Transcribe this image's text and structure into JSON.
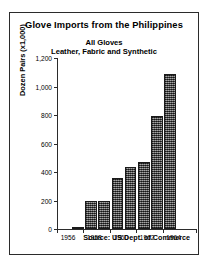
{
  "chart_data": {
    "type": "bar",
    "title": "Glove Imports from the  Philippines",
    "subtitle_line1": "All Gloves",
    "subtitle_line2": "Leather, Fabric and Synthetic",
    "xlabel": "",
    "ylabel": "Dozen Pairs (x1,000)",
    "ylim": [
      0,
      1200
    ],
    "ytick_values": [
      0,
      200,
      400,
      600,
      800,
      1000,
      1200
    ],
    "ytick_labels": [
      "0",
      "200",
      "400",
      "600",
      "800",
      "1,000",
      "1,200"
    ],
    "grid": false,
    "legend": "none",
    "xlim": [
      1956,
      1966
    ],
    "xtick_values": [
      1956,
      1958,
      1960,
      1962,
      1964
    ],
    "xtick_labels": [
      "1956",
      "1958",
      "1960",
      "1962",
      "1964"
    ],
    "categories": [
      1957,
      1958,
      1959,
      1960,
      1961,
      1962,
      1963,
      1964
    ],
    "values": [
      15,
      195,
      195,
      360,
      435,
      470,
      795,
      1085
    ],
    "bar_color": "#5a5a5a",
    "bar_edge_color": "#1a1a1a",
    "annotation_source": "Source: US Dept. of Commerce"
  }
}
